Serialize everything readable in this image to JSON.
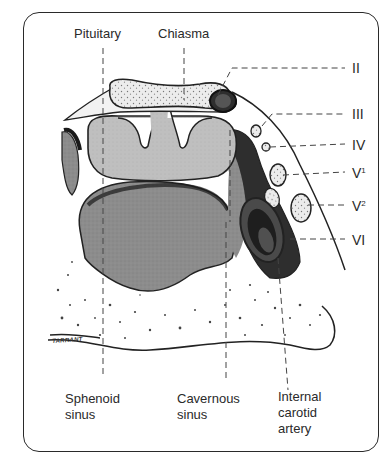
{
  "figure": {
    "type": "anatomical-cross-section"
  },
  "labels": {
    "top": {
      "pituitary": "Pituitary",
      "chiasma": "Chiasma"
    },
    "bottom": {
      "sphenoid_line1": "Sphenoid",
      "sphenoid_line2": "sinus",
      "cavernous_line1": "Cavernous",
      "cavernous_line2": "sinus",
      "carotid_line1": "Internal",
      "carotid_line2": "carotid",
      "carotid_line3": "artery"
    },
    "nerves": {
      "n2": "II",
      "n3": "III",
      "n4": "IV",
      "n5_1_base": "V",
      "n5_1_sup": "1",
      "n5_2_base": "V",
      "n5_2_sup": "2",
      "n6": "VI"
    },
    "signature": "TARRANT"
  },
  "colors": {
    "outline": "#222222",
    "pituitary_fill": "#bdbdbd",
    "sphenoid_fill": "#8e8e8e",
    "cavernous_fill": "#6f6f6f",
    "dark_fill": "#2e2e2e",
    "carotid_fill": "#4a4a4a",
    "nerve_fill": "#dcdcdc",
    "bone_fill": "#ffffff",
    "chiasma_fill": "#e6e6e6"
  }
}
